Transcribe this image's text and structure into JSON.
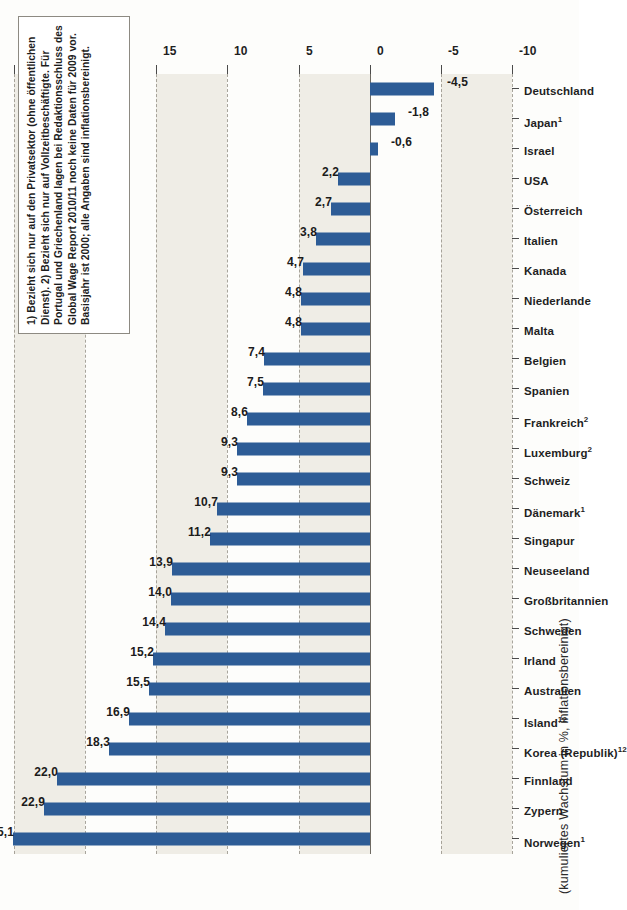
{
  "axis_title": "(kumuliertes Wachstum in %, inflationsbereinigt)",
  "footnote": "1) Bezieht sich nur auf den Privatsektor (ohne öffentlichen Dienst). 2) Bezieht sich nur auf Vollzeitbeschäftigte. Für Portugal und Griechenland lagen bei Redaktionsschluss des Global Wage Report 2010/11 noch keine Daten für 2009 vor. Basisjahr ist 2000; alle Angaben sind inflationsbereinigt.",
  "colors": {
    "bar": "#2d5c96",
    "band": "#efede6",
    "gridline": "#9a968c",
    "zero_line": "#6e6a62",
    "text": "#1f1f1f",
    "paper": "#fdfdfb"
  },
  "chart_data": {
    "type": "bar",
    "title": "",
    "subtitle": "",
    "xlabel": "",
    "ylabel": "(kumuliertes Wachstum in %, inflationsbereinigt)",
    "ylim": [
      -10,
      25
    ],
    "yticks": [
      25,
      20,
      15,
      10,
      5,
      0,
      -5,
      -10
    ],
    "ytick_labels": [
      "25",
      "20",
      "15",
      "10",
      "5",
      "0",
      "-5",
      "-10"
    ],
    "grid": true,
    "legend": null,
    "orientation": "vertical-bars-on-rotated-page",
    "value_label_format": "comma-decimal",
    "categories": [
      "Norwegen¹",
      "Zypern",
      "Finnland",
      "Korea (Republik)¹²",
      "Island¹²",
      "Australien",
      "Irland",
      "Schweden",
      "Großbritannien",
      "Neuseeland",
      "Singapur",
      "Dänemark¹",
      "Schweiz",
      "Luxemburg²",
      "Frankreich²",
      "Spanien",
      "Belgien",
      "Malta",
      "Niederlande",
      "Kanada",
      "Italien",
      "Österreich",
      "USA",
      "Israel",
      "Japan¹",
      "Deutschland"
    ],
    "category_labels_html": [
      "Norwegen<sup>1</sup>",
      "Zypern",
      "Finnland",
      "Korea (Republik)<sup>12</sup>",
      "Island<sup>12</sup>",
      "Australien",
      "Irland",
      "Schweden",
      "Großbritannien",
      "Neuseeland",
      "Singapur",
      "Dänemark<sup>1</sup>",
      "Schweiz",
      "Luxemburg<sup>2</sup>",
      "Frankreich<sup>2</sup>",
      "Spanien",
      "Belgien",
      "Malta",
      "Niederlande",
      "Kanada",
      "Italien",
      "Österreich",
      "USA",
      "Israel",
      "Japan<sup>1</sup>",
      "Deutschland"
    ],
    "values": [
      25.1,
      22.9,
      22.0,
      18.3,
      16.9,
      15.5,
      15.2,
      14.4,
      14.0,
      13.9,
      11.2,
      10.7,
      9.3,
      9.3,
      8.6,
      7.5,
      7.4,
      4.8,
      4.8,
      4.7,
      3.8,
      2.7,
      2.2,
      -0.6,
      -1.8,
      -4.5
    ],
    "value_labels": [
      "25,1",
      "22,9",
      "22,0",
      "18,3",
      "16,9",
      "15,5",
      "15,2",
      "14,4",
      "14,0",
      "13,9",
      "11,2",
      "10,7",
      "9,3",
      "9,3",
      "8,6",
      "7,5",
      "7,4",
      "4,8",
      "4,8",
      "4,7",
      "3,8",
      "2,7",
      "2,2",
      "-0,6",
      "-1,8",
      "-4,5"
    ]
  }
}
